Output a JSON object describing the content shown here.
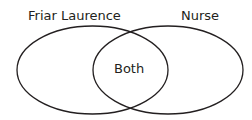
{
  "diagram": {
    "type": "venn",
    "sets": [
      {
        "id": "left",
        "label": "Friar Laurence",
        "ellipse": {
          "cx": 92.5,
          "cy": 70,
          "rx": 75.5,
          "ry": 44
        }
      },
      {
        "id": "right",
        "label": "Nurse",
        "ellipse": {
          "cx": 168,
          "cy": 70,
          "rx": 75,
          "ry": 44
        }
      }
    ],
    "intersection": {
      "label": "Both"
    },
    "colors": {
      "stroke": "#231f20",
      "text": "#231f20",
      "background": "#ffffff"
    }
  }
}
